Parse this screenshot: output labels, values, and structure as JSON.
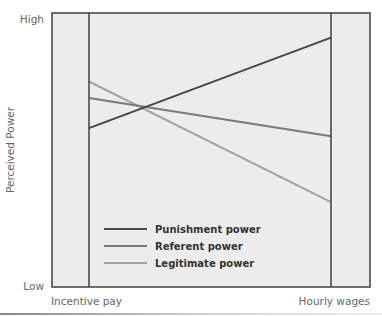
{
  "chart_data": {
    "type": "line",
    "title": "",
    "xlabel": "",
    "ylabel": "Perceived Power",
    "categories": [
      "Incentive pay",
      "Hourly wages"
    ],
    "y_tick_labels": {
      "high": "High",
      "low": "Low"
    },
    "ylim": [
      0,
      100
    ],
    "grid": false,
    "legend_position": "bottom-left",
    "series": [
      {
        "name": "Punishment power",
        "values": [
          58,
          91
        ],
        "color": "#474747"
      },
      {
        "name": "Referent power",
        "values": [
          69,
          55
        ],
        "color": "#7a7a7a"
      },
      {
        "name": "Legitimate power",
        "values": [
          75,
          31
        ],
        "color": "#a3a3a3"
      }
    ]
  },
  "colors": {
    "plot_background": "#ececec",
    "frame": "#3f3f3f"
  }
}
